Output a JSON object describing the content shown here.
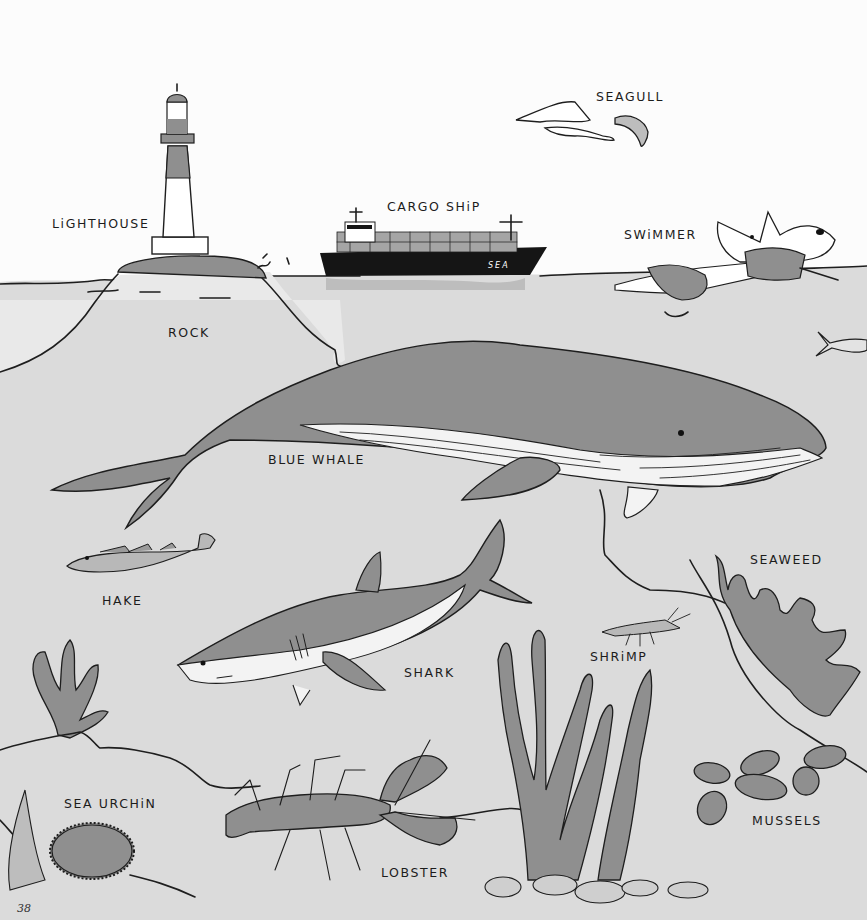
{
  "page": {
    "number": "38",
    "colors": {
      "sky": "#fcfcfc",
      "water": "#dadada",
      "shore": "#e7e7e7",
      "creature": "#8e8e8e",
      "ink": "#1e1e1e",
      "ship_hull": "#151515"
    }
  },
  "labels": {
    "lighthouse": "LiGHTHOUSE",
    "cargo_ship": "CARGO SHiP",
    "seagull": "SEAGULL",
    "swimmer": "SWiMMER",
    "rock": "ROCK",
    "blue_whale": "BLUE WHALE",
    "hake": "HAKE",
    "seaweed": "SEAWEED",
    "shark": "SHARK",
    "shrimp": "SHRiMP",
    "sea_urchin": "SEA URCHiN",
    "lobster": "LOBSTER",
    "mussels": "MUSSELS"
  },
  "ship": {
    "hull_text": "SEA"
  },
  "icons": [
    "lighthouse-icon",
    "cargo-ship-icon",
    "seagull-icon",
    "swimmer-icon",
    "rock-icon",
    "blue-whale-icon",
    "hake-icon",
    "small-fish-icon",
    "seaweed-icon",
    "shark-icon",
    "shrimp-icon",
    "sea-urchin-icon",
    "lobster-icon",
    "mussels-icon",
    "kelp-icon",
    "coral-icon"
  ]
}
